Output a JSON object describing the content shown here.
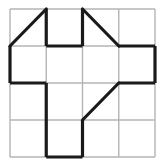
{
  "figure": {
    "kind": "geometric-grid-puzzle",
    "background_color": "#ffffff",
    "grid": {
      "columns": 4,
      "rows": 4,
      "left": 10,
      "top": 9,
      "right": 155,
      "bottom": 157,
      "cell_width": 36.25,
      "cell_height": 37,
      "x_lines": [
        10,
        46.25,
        82.5,
        118.75,
        155
      ],
      "y_lines": [
        9,
        46,
        83,
        120,
        157
      ],
      "thin_color": "#b4b4b4",
      "thin_width": 1.4,
      "thick_color": "#1a1a1a",
      "thick_width": 3.2
    },
    "thick_segments": [
      {
        "name": "top-border-left-of-col1",
        "x1": 46.25,
        "y1": 9,
        "x2": 46.25,
        "y2": 46
      },
      {
        "name": "row1-divider-col1",
        "x1": 46.25,
        "y1": 46,
        "x2": 82.5,
        "y2": 46
      },
      {
        "name": "col2-vertical-row0",
        "x1": 82.5,
        "y1": 9,
        "x2": 82.5,
        "y2": 46
      },
      {
        "name": "row1-divider-col3",
        "x1": 118.75,
        "y1": 46,
        "x2": 155,
        "y2": 46
      },
      {
        "name": "left-border-row1",
        "x1": 10,
        "y1": 46,
        "x2": 10,
        "y2": 83
      },
      {
        "name": "row2-divider-col0",
        "x1": 10,
        "y1": 83,
        "x2": 46.25,
        "y2": 83
      },
      {
        "name": "right-border-row1",
        "x1": 155,
        "y1": 46,
        "x2": 155,
        "y2": 83
      },
      {
        "name": "row2-divider-col3",
        "x1": 118.75,
        "y1": 83,
        "x2": 155,
        "y2": 83
      },
      {
        "name": "col1-vertical-lower",
        "x1": 46.25,
        "y1": 83,
        "x2": 46.25,
        "y2": 157
      },
      {
        "name": "col2-vertical-lower",
        "x1": 82.5,
        "y1": 120,
        "x2": 82.5,
        "y2": 157
      },
      {
        "name": "bottom-border-col1",
        "x1": 46.25,
        "y1": 157,
        "x2": 82.5,
        "y2": 157
      }
    ],
    "diagonals": [
      {
        "name": "diagonal-top-left-cell",
        "x1": 10,
        "y1": 46,
        "x2": 46.25,
        "y2": 9
      },
      {
        "name": "diagonal-top-col2-cell",
        "x1": 82.5,
        "y1": 9,
        "x2": 118.75,
        "y2": 46
      },
      {
        "name": "diagonal-lower-middle-cell",
        "x1": 82.5,
        "y1": 120,
        "x2": 118.75,
        "y2": 83
      }
    ]
  }
}
